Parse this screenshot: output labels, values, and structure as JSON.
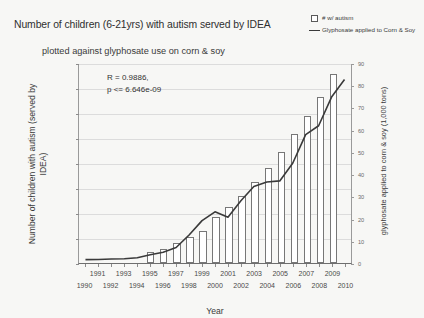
{
  "title": {
    "line1": "Number of children (6-21yrs) with autism served by IDEA",
    "line2": "plotted against glyphosate use on corn & soy"
  },
  "legend": {
    "position": "top-right",
    "items": [
      {
        "label": "# w/ autism",
        "marker": "open-square",
        "color": "#ffffff"
      },
      {
        "label": "Glyphosate applied to Corn & Soy",
        "marker": "line",
        "color": "#3a3a3a"
      }
    ]
  },
  "annotation": {
    "line1": "R = 0.9886,",
    "line2": "p <= 6.646e-09"
  },
  "chart_data": {
    "type": "bar",
    "title": "Number of children (6-21yrs) with autism served by IDEA plotted against glyphosate use on corn & soy",
    "xlabel": "Year",
    "ylabel": "Number of children with autism (served by IDEA)",
    "y2label": "glyphosate applied to corn & soy (1,000 tons)",
    "grid": true,
    "categories": [
      1990,
      1991,
      1992,
      1993,
      1994,
      1995,
      1996,
      1997,
      1998,
      1999,
      2000,
      2001,
      2002,
      2003,
      2004,
      2005,
      2006,
      2007,
      2008,
      2009,
      2010
    ],
    "xlim": [
      1990,
      2010
    ],
    "ylim": [
      0,
      400000
    ],
    "yticks": [
      0,
      50000,
      100000,
      150000,
      200000,
      250000,
      300000,
      350000,
      400000
    ],
    "y2lim": [
      0,
      90
    ],
    "y2ticks": [
      0,
      10,
      20,
      30,
      40,
      50,
      60,
      70,
      80,
      90
    ],
    "series": [
      {
        "name": "# w/ autism",
        "type": "bar",
        "axis": "left",
        "values": [
          0,
          0,
          0,
          0,
          0,
          22000,
          29000,
          40000,
          53000,
          65000,
          93000,
          112000,
          135000,
          163000,
          190000,
          223000,
          258000,
          295000,
          332000,
          378000,
          0
        ]
      },
      {
        "name": "Glyphosate applied to Corn & Soy",
        "type": "line",
        "axis": "right",
        "values": [
          1.3,
          1.4,
          1.6,
          1.7,
          2.2,
          3.5,
          4.7,
          6.8,
          12.5,
          19.0,
          23.0,
          20.5,
          28.0,
          34.5,
          36.5,
          37.0,
          45.0,
          58.0,
          62.0,
          75.0,
          83.0
        ]
      }
    ]
  }
}
